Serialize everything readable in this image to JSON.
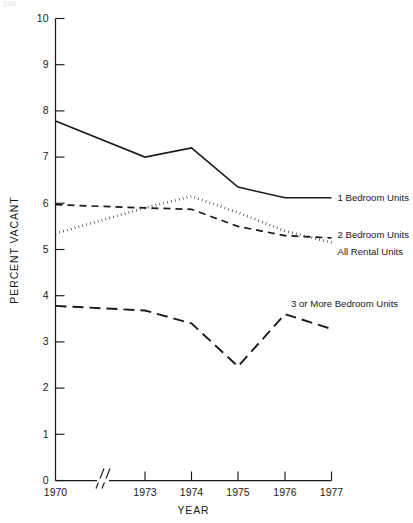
{
  "page": {
    "corner_mark": "100"
  },
  "chart_data": {
    "type": "line",
    "title": "",
    "xlabel": "YEAR",
    "ylabel": "PERCENT VACANT",
    "x": [
      1970,
      1973,
      1974,
      1975,
      1976,
      1977
    ],
    "xtick_labels": [
      "1970",
      "1973",
      "1974",
      "1975",
      "1976",
      "1977"
    ],
    "xlim": [
      1970,
      1977
    ],
    "axis_break": true,
    "axis_break_note": "Axis break between 1970 and 1973",
    "ylim": [
      0,
      10
    ],
    "ytick_labels": [
      "0",
      "1",
      "2",
      "3",
      "4",
      "5",
      "6",
      "7",
      "8",
      "9",
      "10"
    ],
    "yticks": [
      0,
      1,
      2,
      3,
      4,
      5,
      6,
      7,
      8,
      9,
      10
    ],
    "grid": false,
    "legend_position": "right-inline",
    "series": [
      {
        "name": "1 Bedroom Units",
        "style": "solid",
        "color": "#1a1a1a",
        "values": [
          7.78,
          7.0,
          7.2,
          6.35,
          6.12,
          6.12
        ]
      },
      {
        "name": "2 Bedroom Units",
        "style": "dotted",
        "color": "#1a1a1a",
        "values": [
          5.35,
          5.9,
          6.15,
          5.8,
          5.4,
          5.15
        ]
      },
      {
        "name": "All Rental Units",
        "style": "dashed",
        "color": "#1a1a1a",
        "values": [
          5.97,
          5.9,
          5.87,
          5.5,
          5.3,
          5.25
        ]
      },
      {
        "name": "3 or More Bedroom Units",
        "style": "long-dashed",
        "color": "#1a1a1a",
        "values": [
          3.78,
          3.68,
          3.4,
          2.47,
          3.6,
          3.28
        ]
      }
    ],
    "annotations": [
      {
        "text": "1 Bedroom Units",
        "x": 1977,
        "y": 6.12
      },
      {
        "text": "2 Bedroom Units",
        "x": 1977,
        "y": 5.32
      },
      {
        "text": "All Rental Units",
        "x": 1977,
        "y": 4.95
      },
      {
        "text": "3 or More Bedroom Units",
        "x": 1976,
        "y": 3.82
      }
    ]
  }
}
